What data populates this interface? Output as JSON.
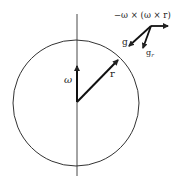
{
  "diagram": {
    "title_expression": "−ω × (ω × r)",
    "labels": {
      "omega": "ω",
      "r": "r",
      "g": "g",
      "g_r": "g",
      "g_r_subscript": "r"
    },
    "circle": {
      "cx": 76,
      "cy": 103,
      "r": 63
    },
    "axis": {
      "x": 77,
      "y1": 14,
      "y2": 176
    },
    "vectors": [
      {
        "name": "omega",
        "from": [
          77,
          102
        ],
        "to": [
          77,
          66
        ]
      },
      {
        "name": "r",
        "from": [
          77,
          102
        ],
        "to": [
          118,
          60
        ]
      },
      {
        "name": "centrifugal",
        "from": [
          151,
          26
        ],
        "to": [
          168,
          26
        ]
      },
      {
        "name": "g",
        "from": [
          151,
          26
        ],
        "to": [
          129,
          46
        ]
      },
      {
        "name": "g_r",
        "from": [
          151,
          26
        ],
        "to": [
          143,
          48
        ]
      }
    ],
    "colors": {
      "stroke": "#222222",
      "background": "#ffffff"
    }
  }
}
